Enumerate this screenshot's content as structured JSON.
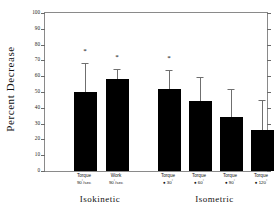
{
  "chart_data": {
    "type": "bar",
    "title": "",
    "xlabel": "",
    "ylabel": "Percent Decrease",
    "ylim": [
      0,
      100
    ],
    "yticks": [
      0,
      10,
      20,
      30,
      40,
      50,
      60,
      70,
      80,
      90,
      100
    ],
    "grid": false,
    "legend": null,
    "bar_color": "#000000",
    "error_color": "#6f6f6f",
    "frame_color": "#8a8a8a",
    "categories": [
      "Torque 90°/sec",
      "Work 90°/sec",
      "Torque @ 30°",
      "Torque @ 60°",
      "Torque @ 90°",
      "Torque @ 120°"
    ],
    "values": [
      50,
      58,
      52,
      44,
      34,
      26
    ],
    "error_upper": [
      68,
      64,
      63,
      59,
      51,
      44
    ],
    "significance": [
      true,
      true,
      true,
      false,
      false,
      false
    ],
    "significance_marker": "*",
    "bars": [
      {
        "group": "Isokinetic",
        "line1": "Torque",
        "line2_prefix": "90",
        "line2_sup": "°",
        "line2_suffix": "/sec",
        "value": 50,
        "error_top": 68,
        "starred": true
      },
      {
        "group": "Isokinetic",
        "line1": "Work",
        "line2_prefix": "90",
        "line2_sup": "°",
        "line2_suffix": "/sec",
        "value": 58,
        "error_top": 64,
        "starred": true
      },
      {
        "group": "Isometric",
        "line1": "Torque",
        "line2_prefix": "● 30",
        "line2_sup": "°",
        "line2_suffix": "",
        "value": 52,
        "error_top": 63,
        "starred": true
      },
      {
        "group": "Isometric",
        "line1": "Torque",
        "line2_prefix": "● 60",
        "line2_sup": "°",
        "line2_suffix": "",
        "value": 44,
        "error_top": 59,
        "starred": false
      },
      {
        "group": "Isometric",
        "line1": "Torque",
        "line2_prefix": "● 90",
        "line2_sup": "°",
        "line2_suffix": "",
        "value": 34,
        "error_top": 51,
        "starred": false
      },
      {
        "group": "Isometric",
        "line1": "Torque",
        "line2_prefix": "● 120",
        "line2_sup": "°",
        "line2_suffix": "",
        "value": 26,
        "error_top": 44,
        "starred": false
      }
    ],
    "groups": [
      {
        "label": "Isokinetic",
        "center_bar_indices": [
          0,
          1
        ]
      },
      {
        "label": "Isometric",
        "center_bar_indices": [
          2,
          3,
          4,
          5
        ]
      }
    ]
  }
}
